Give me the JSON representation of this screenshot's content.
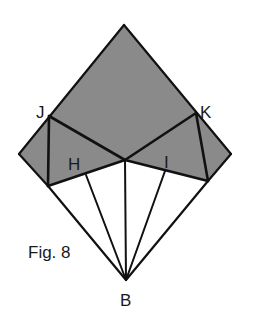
{
  "figure": {
    "caption": "Fig. 8",
    "colors": {
      "shaded": "#8a8a8a",
      "lines": "#111111",
      "background": "#ffffff"
    },
    "labels": {
      "J": "J",
      "K": "K",
      "H": "H",
      "I": "I",
      "B": "B"
    },
    "points": {
      "top": [
        124,
        25
      ],
      "left": [
        19,
        154
      ],
      "right": [
        231,
        154
      ],
      "B": [
        126,
        280
      ],
      "J": [
        49,
        116
      ],
      "K": [
        196,
        113
      ],
      "center": [
        125,
        160
      ],
      "lower_left_fold": [
        48,
        186
      ],
      "lower_right_fold": [
        208,
        181
      ],
      "H_crease_start": [
        86,
        175
      ],
      "I_crease_start": [
        165,
        171
      ]
    }
  }
}
